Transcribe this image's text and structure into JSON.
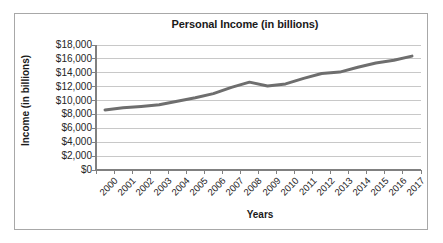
{
  "figure": {
    "title": "Personal Income (in billions)",
    "xlabel": "Years",
    "ylabel": "Income (in billions)",
    "frame_color": "#a8a8a8",
    "line_color": "#6e6e6e",
    "gridline_color": "#c8c8c8",
    "axis_color": "#808080",
    "background": "#ffffff"
  },
  "chart_data": {
    "type": "line",
    "title": "Personal Income (in billions)",
    "xlabel": "Years",
    "ylabel": "Income (in billions)",
    "categories": [
      "2000",
      "2001",
      "2002",
      "2003",
      "2004",
      "2005",
      "2006",
      "2007",
      "2008",
      "2009",
      "2010",
      "2011",
      "2012",
      "2013",
      "2014",
      "2015",
      "2016",
      "2017"
    ],
    "values": [
      8650,
      8950,
      9150,
      9400,
      9900,
      10400,
      11000,
      11900,
      12650,
      12100,
      12400,
      13200,
      13900,
      14100,
      14800,
      15400,
      15800,
      16400
    ],
    "ylim": [
      0,
      18000
    ],
    "y_ticks": [
      0,
      2000,
      4000,
      6000,
      8000,
      10000,
      12000,
      14000,
      16000,
      18000
    ],
    "y_tick_labels": [
      "$0",
      "$2,000",
      "$4,000",
      "$6,000",
      "$8,000",
      "$10,000",
      "$12,000",
      "$14,000",
      "$16,000",
      "$18,000"
    ],
    "grid": "horizontal",
    "legend": "none",
    "markers": "none",
    "line_width": 3
  }
}
